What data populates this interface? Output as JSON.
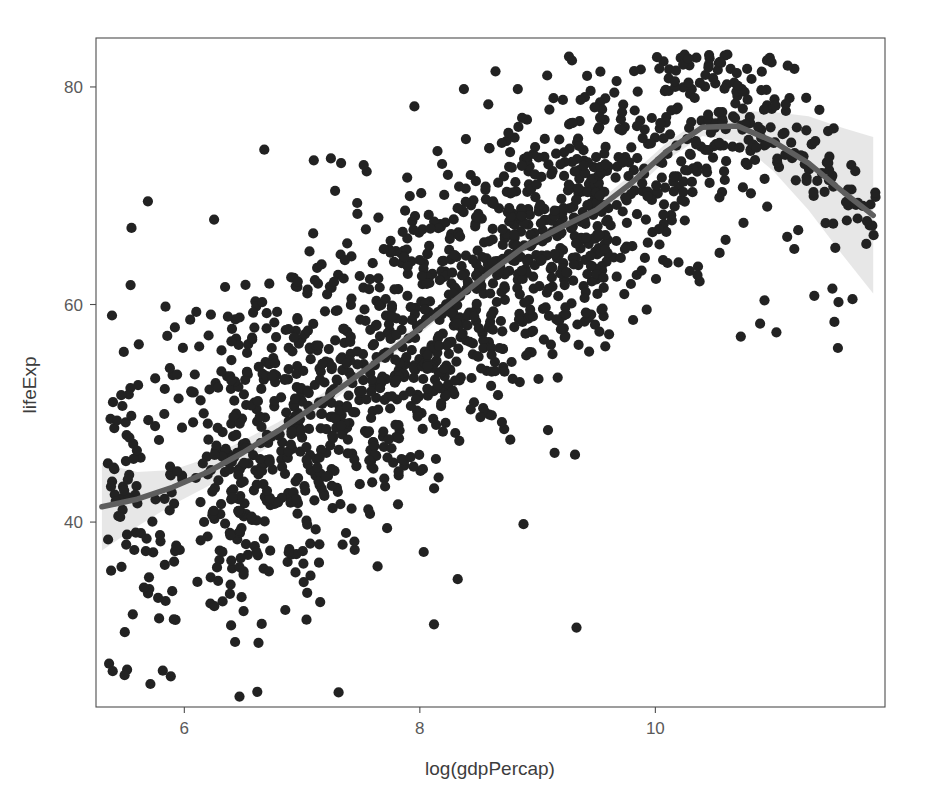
{
  "chart_data": {
    "type": "scatter",
    "title": "",
    "subtitle": "",
    "xlabel": "log(gdpPercap)",
    "ylabel": "lifeExp",
    "xlim": [
      5.25,
      11.95
    ],
    "ylim": [
      23.0,
      84.5
    ],
    "xticks": [
      6,
      8,
      10
    ],
    "xtick_labels": [
      "6",
      "8",
      "10"
    ],
    "yticks": [
      40,
      60,
      80
    ],
    "ytick_labels": [
      "40",
      "60",
      "80"
    ],
    "grid": false,
    "legend": "none",
    "point_color": "#222222",
    "point_size_px": 10,
    "point_opacity": 1.0,
    "n_points": 1704,
    "smoother": {
      "method": "loess",
      "line_color": "#5e5e5e",
      "band_color": "#d8d8d8",
      "band_opacity": 0.62,
      "x": [
        5.3,
        5.6,
        5.9,
        6.2,
        6.5,
        6.8,
        7.1,
        7.4,
        7.7,
        8.0,
        8.3,
        8.6,
        8.9,
        9.2,
        9.5,
        9.8,
        10.1,
        10.4,
        10.7,
        11.0,
        11.3,
        11.6,
        11.85
      ],
      "y": [
        41.4,
        42.1,
        43.2,
        44.6,
        46.4,
        48.4,
        50.6,
        52.9,
        55.3,
        57.8,
        60.4,
        63.0,
        65.4,
        67.1,
        68.7,
        71.2,
        74.1,
        76.3,
        76.4,
        75.0,
        73.0,
        70.3,
        68.2
      ],
      "ymin": [
        37.4,
        39.6,
        41.6,
        43.3,
        45.3,
        47.6,
        49.9,
        52.3,
        54.8,
        57.3,
        59.9,
        62.5,
        64.9,
        66.6,
        68.1,
        70.4,
        73.3,
        75.5,
        75.0,
        72.3,
        68.7,
        64.4,
        61.0
      ],
      "ymax": [
        45.4,
        44.6,
        44.8,
        45.9,
        47.5,
        49.2,
        51.3,
        53.5,
        55.8,
        58.3,
        60.9,
        63.5,
        65.9,
        67.6,
        69.3,
        72.0,
        74.9,
        77.1,
        77.8,
        77.7,
        77.3,
        76.2,
        75.4
      ]
    },
    "series": [
      {
        "name": "countries",
        "description": "lifeExp versus log(gdpPercap), one point per country-year",
        "marker": "filled-circle"
      }
    ],
    "annotations": []
  },
  "panel": {
    "background": "#ffffff",
    "border_color": "#4d4d4d",
    "left_px": 96,
    "right_px": 885,
    "top_px": 38,
    "bottom_px": 707
  }
}
